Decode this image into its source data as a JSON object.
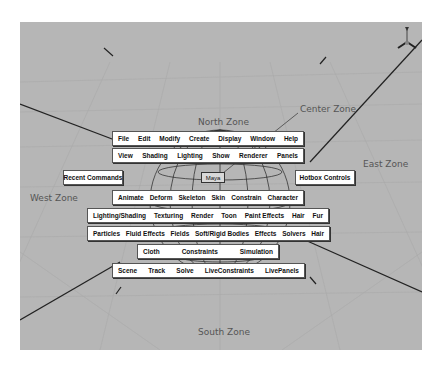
{
  "zones": {
    "north": "North Zone",
    "south": "South Zone",
    "east": "East Zone",
    "west": "West Zone",
    "center": "Center Zone"
  },
  "hotbox": {
    "row1": [
      "File",
      "Edit",
      "Modify",
      "Create",
      "Display",
      "Window",
      "Help"
    ],
    "row2": [
      "View",
      "Shading",
      "Lighting",
      "Show",
      "Renderer",
      "Panels"
    ],
    "recent_commands": "Recent Commands",
    "hotbox_controls": "Hotbox Controls",
    "center_button": "Maya",
    "row_animate": [
      "Animate",
      "Deform",
      "Skeleton",
      "Skin",
      "Constrain",
      "Character"
    ],
    "row_rendering": [
      "Lighting/Shading",
      "Texturing",
      "Render",
      "Toon",
      "Paint Effects",
      "Hair",
      "Fur"
    ],
    "row_dynamics": [
      "Particles",
      "Fluid Effects",
      "Fields",
      "Soft/Rigid Bodies",
      "Effects",
      "Solvers",
      "Hair"
    ],
    "row_cloth": [
      "Cloth",
      "Constraints",
      "Simulation"
    ],
    "row_live": [
      "Scene",
      "Track",
      "Solve",
      "LiveConstraints",
      "LivePanels"
    ]
  },
  "axis_indicator": {
    "label": "Y"
  },
  "colors": {
    "viewport_bg": "#b6b6b6",
    "menu_bg": "#ffffff",
    "lines": "#2a2a2a"
  }
}
